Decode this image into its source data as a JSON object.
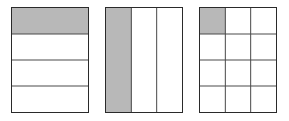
{
  "figures": [
    {
      "id": "fraction-rows",
      "rows": 4,
      "cols": 1,
      "shaded": [
        [
          0,
          0
        ]
      ],
      "box": {
        "x": 11,
        "y": 7,
        "w": 78,
        "h": 106
      }
    },
    {
      "id": "fraction-cols",
      "rows": 1,
      "cols": 3,
      "shaded": [
        [
          0,
          0
        ]
      ],
      "box": {
        "x": 105,
        "y": 7,
        "w": 78,
        "h": 106
      }
    },
    {
      "id": "fraction-grid",
      "rows": 4,
      "cols": 3,
      "shaded": [
        [
          0,
          0
        ]
      ],
      "box": {
        "x": 199,
        "y": 7,
        "w": 78,
        "h": 106
      }
    }
  ],
  "colors": {
    "shade": "#b8b8b8",
    "line": "#4a4a4a",
    "border": "#2a2a2a"
  }
}
